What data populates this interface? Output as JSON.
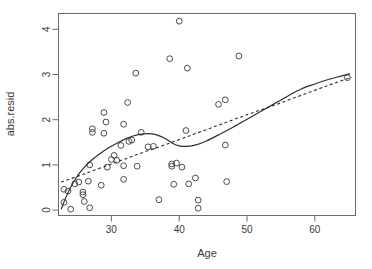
{
  "chart_data": {
    "type": "scatter",
    "title": "",
    "xlabel": "Age",
    "ylabel": "abs.resid",
    "xlim": [
      22.2,
      66.0
    ],
    "ylim": [
      -0.12,
      4.35
    ],
    "xticks": [
      30,
      40,
      50,
      60
    ],
    "yticks": [
      0,
      1,
      2,
      3,
      4
    ],
    "xtick_labels": [
      "30",
      "40",
      "50",
      "60"
    ],
    "ytick_labels": [
      "0",
      "1",
      "2",
      "3",
      "4"
    ],
    "grid": false,
    "legend": "none",
    "point_marker": "open-circle",
    "points": [
      {
        "x": 23.0,
        "y": 0.46
      },
      {
        "x": 23.0,
        "y": 0.17
      },
      {
        "x": 23.6,
        "y": 0.42
      },
      {
        "x": 24.0,
        "y": 0.02
      },
      {
        "x": 24.6,
        "y": 0.58
      },
      {
        "x": 25.2,
        "y": 0.62
      },
      {
        "x": 25.8,
        "y": 0.4
      },
      {
        "x": 25.8,
        "y": 0.34
      },
      {
        "x": 26.0,
        "y": 0.19
      },
      {
        "x": 26.6,
        "y": 0.64
      },
      {
        "x": 26.8,
        "y": 1.0
      },
      {
        "x": 26.8,
        "y": 0.05
      },
      {
        "x": 27.2,
        "y": 1.8
      },
      {
        "x": 27.2,
        "y": 1.72
      },
      {
        "x": 28.5,
        "y": 0.55
      },
      {
        "x": 28.9,
        "y": 2.16
      },
      {
        "x": 28.9,
        "y": 1.7
      },
      {
        "x": 29.2,
        "y": 1.95
      },
      {
        "x": 29.4,
        "y": 0.95
      },
      {
        "x": 30.0,
        "y": 1.12
      },
      {
        "x": 30.4,
        "y": 1.21
      },
      {
        "x": 30.8,
        "y": 1.1
      },
      {
        "x": 31.4,
        "y": 1.43
      },
      {
        "x": 31.8,
        "y": 1.9
      },
      {
        "x": 31.8,
        "y": 0.98
      },
      {
        "x": 31.8,
        "y": 0.68
      },
      {
        "x": 32.4,
        "y": 2.38
      },
      {
        "x": 32.6,
        "y": 1.52
      },
      {
        "x": 33.0,
        "y": 1.55
      },
      {
        "x": 33.6,
        "y": 3.03
      },
      {
        "x": 33.8,
        "y": 0.97
      },
      {
        "x": 34.4,
        "y": 1.72
      },
      {
        "x": 35.4,
        "y": 1.4
      },
      {
        "x": 36.2,
        "y": 1.41
      },
      {
        "x": 37.0,
        "y": 0.23
      },
      {
        "x": 38.6,
        "y": 3.35
      },
      {
        "x": 38.9,
        "y": 1.02
      },
      {
        "x": 38.9,
        "y": 0.97
      },
      {
        "x": 39.2,
        "y": 0.57
      },
      {
        "x": 39.6,
        "y": 1.04
      },
      {
        "x": 40.0,
        "y": 4.18
      },
      {
        "x": 40.4,
        "y": 0.95
      },
      {
        "x": 41.0,
        "y": 1.76
      },
      {
        "x": 41.2,
        "y": 3.14
      },
      {
        "x": 41.4,
        "y": 0.58
      },
      {
        "x": 42.4,
        "y": 0.71
      },
      {
        "x": 42.8,
        "y": 0.22
      },
      {
        "x": 42.8,
        "y": 0.04
      },
      {
        "x": 45.8,
        "y": 2.34
      },
      {
        "x": 46.8,
        "y": 2.44
      },
      {
        "x": 46.8,
        "y": 1.44
      },
      {
        "x": 47.0,
        "y": 0.63
      },
      {
        "x": 48.8,
        "y": 3.41
      },
      {
        "x": 64.8,
        "y": 2.93
      }
    ],
    "series": [
      {
        "name": "loess-smooth",
        "style": "solid",
        "path": [
          {
            "x": 22.6,
            "y": 0.02
          },
          {
            "x": 23.4,
            "y": 0.32
          },
          {
            "x": 24.2,
            "y": 0.56
          },
          {
            "x": 25.2,
            "y": 0.8
          },
          {
            "x": 26.2,
            "y": 0.98
          },
          {
            "x": 27.2,
            "y": 1.12
          },
          {
            "x": 28.4,
            "y": 1.26
          },
          {
            "x": 29.6,
            "y": 1.38
          },
          {
            "x": 30.8,
            "y": 1.48
          },
          {
            "x": 32.0,
            "y": 1.57
          },
          {
            "x": 33.2,
            "y": 1.64
          },
          {
            "x": 34.4,
            "y": 1.68
          },
          {
            "x": 35.6,
            "y": 1.69
          },
          {
            "x": 36.8,
            "y": 1.66
          },
          {
            "x": 38.0,
            "y": 1.58
          },
          {
            "x": 39.0,
            "y": 1.48
          },
          {
            "x": 40.0,
            "y": 1.42
          },
          {
            "x": 41.2,
            "y": 1.41
          },
          {
            "x": 42.6,
            "y": 1.45
          },
          {
            "x": 44.0,
            "y": 1.53
          },
          {
            "x": 46.0,
            "y": 1.68
          },
          {
            "x": 48.0,
            "y": 1.84
          },
          {
            "x": 50.0,
            "y": 2.01
          },
          {
            "x": 52.0,
            "y": 2.18
          },
          {
            "x": 54.0,
            "y": 2.35
          },
          {
            "x": 56.0,
            "y": 2.52
          },
          {
            "x": 58.0,
            "y": 2.68
          },
          {
            "x": 60.0,
            "y": 2.79
          },
          {
            "x": 62.0,
            "y": 2.89
          },
          {
            "x": 64.0,
            "y": 2.97
          },
          {
            "x": 65.2,
            "y": 3.02
          }
        ]
      },
      {
        "name": "linear-fit",
        "style": "dashed",
        "path": [
          {
            "x": 22.6,
            "y": 0.62
          },
          {
            "x": 26.0,
            "y": 0.8
          },
          {
            "x": 30.0,
            "y": 1.02
          },
          {
            "x": 34.0,
            "y": 1.24
          },
          {
            "x": 38.0,
            "y": 1.45
          },
          {
            "x": 42.0,
            "y": 1.67
          },
          {
            "x": 46.0,
            "y": 1.89
          },
          {
            "x": 50.0,
            "y": 2.11
          },
          {
            "x": 54.0,
            "y": 2.32
          },
          {
            "x": 58.0,
            "y": 2.54
          },
          {
            "x": 62.0,
            "y": 2.76
          },
          {
            "x": 65.4,
            "y": 2.94
          }
        ]
      }
    ]
  },
  "axes": {
    "x_title": "Age",
    "y_title": "abs.resid"
  }
}
